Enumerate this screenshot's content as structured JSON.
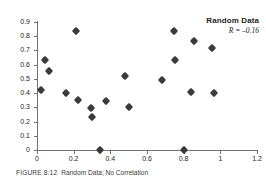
{
  "figure": {
    "caption_label": "FIGURE 8.12",
    "caption_text": "Random Data; No Correlation",
    "annotation_title": "Random Data",
    "annotation_r": "R = –0.16",
    "marker_color": "#3a3a3c",
    "axis_color": "#6f7173",
    "text_color": "#231f20",
    "background": "#ffffff"
  },
  "chart_data": {
    "type": "scatter",
    "title": "Random Data",
    "subtitle": "R = -0.16",
    "xlabel": "",
    "ylabel": "",
    "xlim": [
      0,
      1.2
    ],
    "ylim": [
      0,
      0.9
    ],
    "grid": false,
    "legend": false,
    "xticks": [
      0,
      0.2,
      0.4,
      0.6,
      0.8,
      1,
      1.2
    ],
    "xticklabels": [
      "0",
      "0.2",
      "0.4",
      "0.6",
      "0.8",
      "1",
      "1.2"
    ],
    "yticks": [
      0,
      0.1,
      0.2,
      0.3,
      0.4,
      0.5,
      0.6,
      0.7,
      0.8,
      0.9
    ],
    "yticklabels": [
      "0",
      "0.1",
      "0.2",
      "0.3",
      "0.4",
      "0.5",
      "0.6",
      "0.7",
      "0.8",
      "0.9"
    ],
    "marker": "diamond",
    "r_value": -0.16,
    "n_points": 22,
    "points": [
      {
        "x": 0.02,
        "y": 0.425
      },
      {
        "x": 0.045,
        "y": 0.635
      },
      {
        "x": 0.065,
        "y": 0.555
      },
      {
        "x": 0.16,
        "y": 0.4
      },
      {
        "x": 0.215,
        "y": 0.835
      },
      {
        "x": 0.225,
        "y": 0.355
      },
      {
        "x": 0.295,
        "y": 0.295
      },
      {
        "x": 0.3,
        "y": 0.235
      },
      {
        "x": 0.345,
        "y": 0.0
      },
      {
        "x": 0.375,
        "y": 0.345
      },
      {
        "x": 0.48,
        "y": 0.52
      },
      {
        "x": 0.5,
        "y": 0.305
      },
      {
        "x": 0.68,
        "y": 0.49
      },
      {
        "x": 0.745,
        "y": 0.835
      },
      {
        "x": 0.755,
        "y": 0.63
      },
      {
        "x": 0.8,
        "y": 0.0
      },
      {
        "x": 0.84,
        "y": 0.41
      },
      {
        "x": 0.855,
        "y": 0.765
      },
      {
        "x": 0.955,
        "y": 0.715
      },
      {
        "x": 0.965,
        "y": 0.4
      }
    ]
  }
}
